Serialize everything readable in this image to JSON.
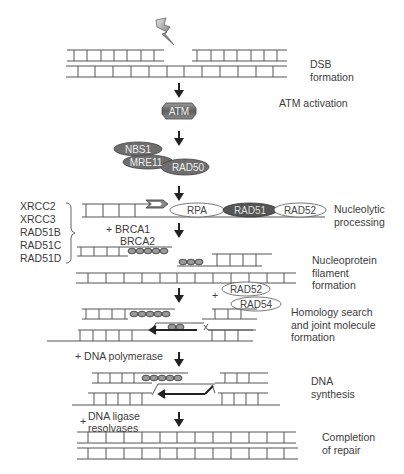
{
  "diagram": {
    "type": "pathway",
    "title": "",
    "steps": [
      {
        "id": "dsb",
        "label_lines": [
          "DSB",
          "formation"
        ]
      },
      {
        "id": "atm",
        "label_lines": [
          "ATM activation"
        ]
      },
      {
        "id": "nucleolytic",
        "label_lines": [
          "Nucleolytic",
          "processing"
        ]
      },
      {
        "id": "filament",
        "label_lines": [
          "Nucleoprotein",
          "filament",
          "formation"
        ]
      },
      {
        "id": "homology",
        "label_lines": [
          "Homology search",
          "and joint molecule",
          "formation"
        ]
      },
      {
        "id": "synthesis",
        "label_lines": [
          "DNA",
          "synthesis"
        ]
      },
      {
        "id": "completion",
        "label_lines": [
          "Completion",
          "of repair"
        ]
      }
    ],
    "proteins": {
      "atm": "ATM",
      "nbs1": "NBS1",
      "mre11": "MRE11",
      "rad50": "RAD50",
      "rpa": "RPA",
      "rad51": "RAD51",
      "rad52": "RAD52",
      "rad52b": "RAD52",
      "rad54": "RAD54"
    },
    "paralogs": [
      "XRCC2",
      "XRCC3",
      "RAD51B",
      "RAD51C",
      "RAD51D"
    ],
    "cofactors": {
      "brca": [
        "+ BRCA1",
        "BRCA2"
      ],
      "plus": "+",
      "polymerase": "+  DNA polymerase",
      "ligase_plus": "+",
      "ligase": [
        "DNA ligase",
        "resolvases"
      ]
    },
    "colors": {
      "line": "#555555",
      "dark_protein": "#6a6a6a",
      "darker_protein": "#4a4a4a",
      "light_protein": "#ffffff",
      "arrow": "#222222"
    }
  }
}
